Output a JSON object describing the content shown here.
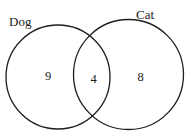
{
  "diagram": {
    "type": "venn",
    "sets": [
      {
        "id": "dog",
        "label": "Dog",
        "only_value": "9",
        "circle": {
          "cx": 58,
          "cy": 77,
          "r": 52
        }
      },
      {
        "id": "cat",
        "label": "Cat",
        "only_value": "8",
        "circle": {
          "cx": 128.5,
          "cy": 74.5,
          "r": 55
        }
      }
    ],
    "intersection": {
      "sets": [
        "dog",
        "cat"
      ],
      "value": "4"
    },
    "colors": {
      "stroke": "#1e1e1e",
      "text": "#1a1a1a",
      "background": "#ffffff"
    }
  }
}
